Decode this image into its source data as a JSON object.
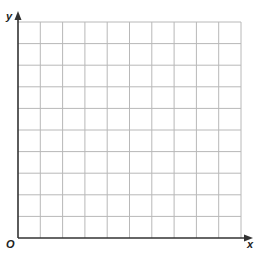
{
  "diagram": {
    "type": "coordinate-grid",
    "axes": {
      "x_label": "x",
      "y_label": "y",
      "origin_label": "O"
    },
    "grid": {
      "columns": 10,
      "rows": 10,
      "line_color": "#b8b8b8",
      "axis_color": "#333333"
    }
  }
}
